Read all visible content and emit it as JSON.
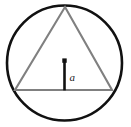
{
  "figure": {
    "name": "equilateral-triangle-inscribed-in-circle-with-apothem",
    "background_color": "#ffffff",
    "width": 131,
    "height": 127,
    "circle": {
      "name": "circumscribed-circle",
      "center_x": 64.5,
      "center_y": 63,
      "radius": 57.5,
      "stroke_color": "#111111",
      "stroke_width": 2.6,
      "fill": "none"
    },
    "triangle": {
      "name": "inscribed-equilateral-triangle",
      "points": "65,7 112,90 15,90",
      "vertices": [
        {
          "label": "apex",
          "x": 65,
          "y": 7
        },
        {
          "label": "bottom-right",
          "x": 112,
          "y": 90
        },
        {
          "label": "bottom-left",
          "x": 15,
          "y": 90
        }
      ],
      "stroke_color": "#808080",
      "stroke_width": 2.1,
      "fill": "none"
    },
    "apothem": {
      "name": "apothem-segment",
      "x1": 64.5,
      "y1": 61,
      "x2": 64.5,
      "y2": 90,
      "stroke_color": "#111111",
      "stroke_width": 2.6,
      "label": "a",
      "label_x": 69.5,
      "label_y": 81,
      "label_color": "#1a1a1a"
    },
    "center_marker": {
      "name": "circle-center-dot",
      "x": 64.5,
      "y": 60.5,
      "size": 4.4,
      "color": "#111111"
    }
  }
}
